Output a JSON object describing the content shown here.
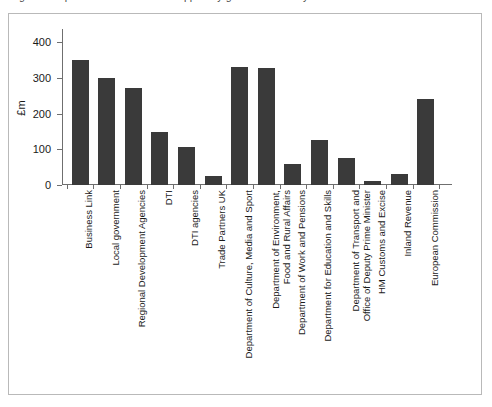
{
  "caption": {
    "text": "Figure 3  Expenditure on business support by government body"
  },
  "figure": {
    "border_color": "#b9b9b9",
    "background": "#ffffff"
  },
  "chart_data": {
    "type": "bar",
    "title": "",
    "subtitle": "",
    "xlabel": "",
    "ylabel": "£m",
    "ylim": [
      0,
      400
    ],
    "yticks": [
      0,
      100,
      200,
      300,
      400
    ],
    "grid": false,
    "legend": false,
    "bar_color": "#3a3a3a",
    "axis_color": "#6f6f6f",
    "categories": [
      "Business Link",
      "Local government",
      "Regional Development Agencies",
      "DTI",
      "DTI agencies",
      "Trade Partners UK",
      "Department of Culture, Media and Sport",
      "Department of Environment,\nFood and Rural Affairs",
      "Department of Work and Pensions",
      "Department for Education and Skills",
      "Department of Transport and\nOffice of Deputy Prime Minister",
      "HM Customs and Excise",
      "Inland Revenue",
      "European Commission"
    ],
    "values": [
      350,
      300,
      272,
      148,
      105,
      25,
      330,
      326,
      60,
      127,
      76,
      10,
      30,
      240
    ]
  }
}
